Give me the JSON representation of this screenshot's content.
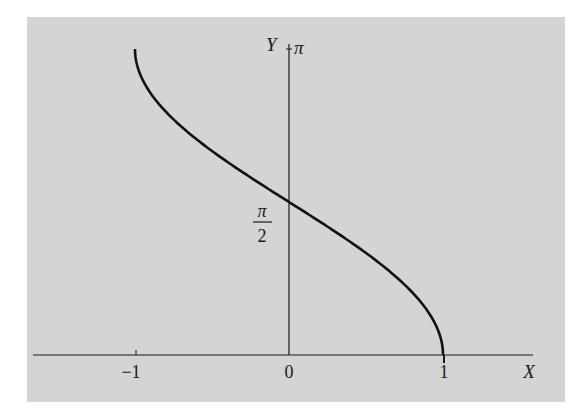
{
  "colors": {
    "background": "#ffffff",
    "panel": "#d4d4d4",
    "ink": "#1a1a1a"
  },
  "axes": {
    "x_label": "X",
    "y_label": "Y",
    "x_ticks": [
      "−1",
      "0",
      "1"
    ],
    "y_ticks": [
      {
        "label": "π",
        "numerator": "π",
        "denominator": "",
        "value": 3.14159
      },
      {
        "label": "π/2",
        "numerator": "π",
        "denominator": "2",
        "value": 1.5708
      }
    ]
  },
  "chart_data": {
    "type": "line",
    "title": "",
    "xlabel": "X",
    "ylabel": "Y",
    "xlim": [
      -1.6,
      1.75
    ],
    "ylim": [
      0,
      3.14159
    ],
    "grid": false,
    "legend": null,
    "x_tick_labels": [
      "-1",
      "0",
      "1"
    ],
    "y_tick_labels": [
      "π/2",
      "π"
    ],
    "series": [
      {
        "name": "Y = arccos X",
        "x": [
          -1,
          -0.9,
          -0.75,
          -0.5,
          -0.25,
          0,
          0.25,
          0.5,
          0.75,
          0.9,
          1
        ],
        "y": [
          3.1416,
          2.6906,
          2.4189,
          2.0944,
          1.8235,
          1.5708,
          1.3181,
          1.0472,
          0.7227,
          0.451,
          0
        ]
      }
    ],
    "annotations": [
      "π at top of Y axis",
      "π/2 at Y-intercept"
    ]
  }
}
